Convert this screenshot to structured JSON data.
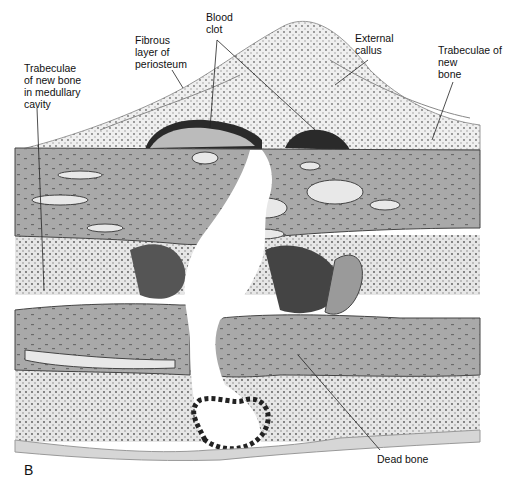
{
  "figure": {
    "panel_letter": "B",
    "labels": {
      "trabeculae_medullary": "Trabeculae\nof new bone\nin medullary\ncavity",
      "fibrous_periosteum": "Fibrous\nlayer of\nperiosteum",
      "blood_clot": "Blood\nclot",
      "external_callus": "External\ncallus",
      "trabeculae_new_bone": "Trabeculae of\nnew\nbone",
      "dead_bone": "Dead bone"
    }
  }
}
